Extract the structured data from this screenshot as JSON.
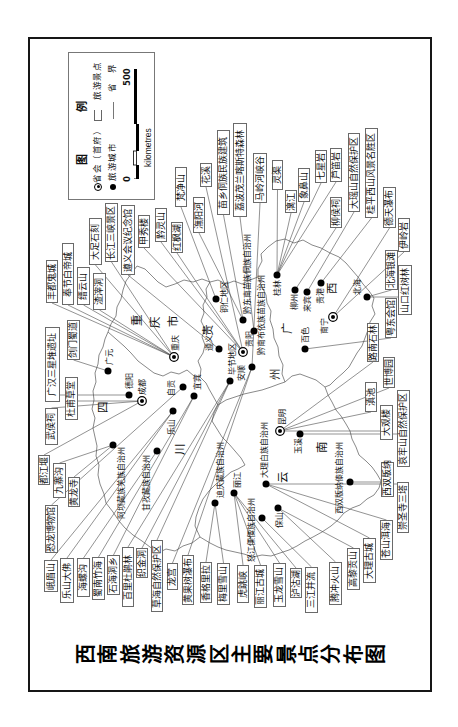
{
  "title": "西南旅游资源区主要景点分布图",
  "legend": {
    "title_chars": [
      "图",
      "例"
    ],
    "items": [
      {
        "symbol": "capital-circle",
        "label": "省会（首府）"
      },
      {
        "symbol": "label-box",
        "label": "旅游景点"
      },
      {
        "symbol": "black-dot",
        "label": "旅游城市"
      },
      {
        "symbol": "boundary-line",
        "label": "省　界"
      }
    ],
    "scale": {
      "start": "0",
      "end": "500",
      "unit": "kilometres"
    }
  },
  "map": {
    "provinces": [
      {
        "name": "重庆市",
        "chars": [
          {
            "c": "重",
            "x": 407,
            "y": 137
          },
          {
            "c": "庆",
            "x": 405,
            "y": 155
          },
          {
            "c": "市",
            "x": 406,
            "y": 173
          }
        ]
      },
      {
        "name": "四川",
        "chars": [
          {
            "c": "四",
            "x": 320,
            "y": 103
          },
          {
            "c": "川",
            "x": 278,
            "y": 180
          }
        ]
      },
      {
        "name": "贵州",
        "chars": [
          {
            "c": "贵",
            "x": 397,
            "y": 208
          },
          {
            "c": "州",
            "x": 353,
            "y": 275
          }
        ]
      },
      {
        "name": "云南",
        "chars": [
          {
            "c": "云",
            "x": 250,
            "y": 283
          },
          {
            "c": "南",
            "x": 280,
            "y": 322
          }
        ]
      },
      {
        "name": "广西",
        "chars": [
          {
            "c": "广",
            "x": 399,
            "y": 287
          },
          {
            "c": "西",
            "x": 439,
            "y": 332
          }
        ]
      }
    ],
    "cities": [
      {
        "name": "重庆",
        "type": "capital",
        "x": 370,
        "y": 174,
        "lx": 376,
        "ly": 176
      },
      {
        "name": "成都",
        "type": "capital",
        "x": 326,
        "y": 142,
        "lx": 332,
        "ly": 143
      },
      {
        "name": "贵阳",
        "type": "capital",
        "x": 375,
        "y": 243,
        "lx": 380,
        "ly": 250
      },
      {
        "name": "昆明",
        "type": "capital",
        "x": 296,
        "y": 280,
        "lx": 302,
        "ly": 283
      },
      {
        "name": "南宁",
        "type": "capital",
        "x": 410,
        "y": 333,
        "lx": 393,
        "ly": 325
      },
      {
        "name": "广元",
        "type": "city",
        "x": 356,
        "y": 108,
        "lx": 362,
        "ly": 110
      },
      {
        "name": "德阳",
        "type": "city",
        "x": 332,
        "y": 129,
        "lx": 338,
        "ly": 130
      },
      {
        "name": "自贡",
        "type": "city",
        "x": 340,
        "y": 183,
        "lx": 331,
        "ly": 172
      },
      {
        "name": "宜宾",
        "type": "city",
        "x": 331,
        "y": 194,
        "lx": 337,
        "ly": 198
      },
      {
        "name": "乐山",
        "type": "city",
        "x": 316,
        "y": 173,
        "lx": 292,
        "ly": 172
      },
      {
        "name": "阿坝藏族羌族自治州",
        "type": "city",
        "x": 282,
        "y": 113,
        "lx": 208,
        "ly": 122
      },
      {
        "name": "甘孜藏族自治州",
        "type": "city",
        "x": 276,
        "y": 157,
        "lx": 216,
        "ly": 147
      },
      {
        "name": "遵义",
        "type": "city",
        "x": 378,
        "y": 219,
        "lx": 376,
        "ly": 210
      },
      {
        "name": "毕节地区",
        "type": "city",
        "x": 346,
        "y": 230,
        "lx": 352,
        "ly": 233
      },
      {
        "name": "铜仁地区",
        "type": "city",
        "x": 428,
        "y": 216,
        "lx": 414,
        "ly": 225
      },
      {
        "name": "黔东南苗族侗族自治州",
        "type": "city",
        "x": 407,
        "y": 243,
        "lx": 413,
        "ly": 248
      },
      {
        "name": "黔南布依族苗族自治州",
        "type": "city",
        "x": 396,
        "y": 254,
        "lx": 372,
        "ly": 262
      },
      {
        "name": "安顺",
        "type": "city",
        "x": 360,
        "y": 252,
        "lx": 346,
        "ly": 242
      },
      {
        "name": "桂林",
        "type": "city",
        "x": 452,
        "y": 277,
        "lx": 431,
        "ly": 278
      },
      {
        "name": "柳州",
        "type": "city",
        "x": 437,
        "y": 295,
        "lx": 417,
        "ly": 295
      },
      {
        "name": "来宾",
        "type": "city",
        "x": 435,
        "y": 307,
        "lx": 415,
        "ly": 308
      },
      {
        "name": "贵港",
        "type": "city",
        "x": 444,
        "y": 321,
        "lx": 423,
        "ly": 321
      },
      {
        "name": "北海",
        "type": "city",
        "x": 430,
        "y": 367,
        "lx": 432,
        "ly": 358
      },
      {
        "name": "百色",
        "type": "city",
        "x": 378,
        "y": 305,
        "lx": 384,
        "ly": 306
      },
      {
        "name": "玉溪",
        "type": "city",
        "x": 293,
        "y": 300,
        "lx": 273,
        "ly": 299
      },
      {
        "name": "西双版纳傣族自治州",
        "type": "city",
        "x": 245,
        "y": 350,
        "lx": 213,
        "ly": 340
      },
      {
        "name": "大理白族自治州",
        "type": "city",
        "x": 243,
        "y": 266,
        "lx": 249,
        "ly": 265
      },
      {
        "name": "丽江",
        "type": "city",
        "x": 234,
        "y": 234,
        "lx": 239,
        "ly": 238
      },
      {
        "name": "迪庆藏族自治州",
        "type": "city",
        "x": 224,
        "y": 215,
        "lx": 229,
        "ly": 221
      },
      {
        "name": "怒江傈僳族自治州",
        "type": "city",
        "x": 209,
        "y": 262,
        "lx": 165,
        "ly": 252
      },
      {
        "name": "保山",
        "type": "city",
        "x": 219,
        "y": 278,
        "lx": 199,
        "ly": 280
      }
    ],
    "spots": [
      {
        "name": "丰都鬼城",
        "box": [
          424,
          46,
          43,
          12
        ],
        "target": "重庆"
      },
      {
        "name": "奉节白帝城",
        "box": [
          422,
          62,
          62,
          12
        ],
        "target": "重庆"
      },
      {
        "name": "缙云山",
        "box": [
          422,
          77,
          38,
          13
        ],
        "target": "重庆"
      },
      {
        "name": "渣滓洞",
        "box": [
          417,
          93,
          37,
          13
        ],
        "target": "重庆"
      },
      {
        "name": "大足石刻",
        "box": [
          462,
          89,
          47,
          13
        ],
        "target": "重庆"
      },
      {
        "name": "长江三峡景区",
        "box": [
          465,
          105,
          59,
          13
        ],
        "target": "重庆"
      },
      {
        "name": "遵义会议纪念馆",
        "box": [
          452,
          121,
          70,
          14
        ],
        "target": "遵义"
      },
      {
        "name": "甲秀楼",
        "box": [
          479,
          138,
          33,
          12
        ],
        "target": "贵阳"
      },
      {
        "name": "黔灵山",
        "box": [
          485,
          155,
          34,
          12
        ],
        "target": "贵阳"
      },
      {
        "name": "红枫湖",
        "box": [
          474,
          171,
          31,
          12
        ],
        "target": "贵阳"
      },
      {
        "name": "梵净山",
        "box": [
          520,
          175,
          40,
          12
        ],
        "target": "铜仁地区"
      },
      {
        "name": "潕阳河",
        "box": [
          494,
          193,
          36,
          12
        ],
        "target": "黔东南苗族侗族自治州"
      },
      {
        "name": "花溪",
        "box": [
          540,
          200,
          24,
          12
        ],
        "target": "贵阳"
      },
      {
        "name": "苗乡侗族民族建筑",
        "box": [
          512,
          217,
          85,
          13
        ],
        "target": "黔东南苗族侗族自治州"
      },
      {
        "name": "荔波茂兰喀斯特森林",
        "box": [
          510,
          233,
          94,
          14
        ],
        "target": "黔南布依族苗族自治州"
      },
      {
        "name": "马岭河峡谷",
        "box": [
          524,
          253,
          50,
          14
        ],
        "target": "安顺"
      },
      {
        "name": "灵渠",
        "box": [
          537,
          272,
          30,
          11
        ],
        "target": "桂林"
      },
      {
        "name": "漓江",
        "box": [
          514,
          285,
          23,
          12
        ],
        "target": "桂林"
      },
      {
        "name": "象鼻山",
        "box": [
          525,
          298,
          34,
          12
        ],
        "target": "桂林"
      },
      {
        "name": "七星岩",
        "box": [
          544,
          315,
          33,
          12
        ],
        "target": "桂林"
      },
      {
        "name": "芦笛岩",
        "box": [
          545,
          330,
          34,
          12
        ],
        "target": "桂林"
      },
      {
        "name": "柳侯祠",
        "box": [
          499,
          330,
          31,
          12
        ],
        "target": "柳州"
      },
      {
        "name": "大瑶山自然保护区",
        "box": [
          515,
          348,
          79,
          12
        ],
        "target": "来宾"
      },
      {
        "name": "桂平西山风景名胜区",
        "box": [
          509,
          365,
          90,
          13
        ],
        "target": "贵港"
      },
      {
        "name": "德天瀑布",
        "box": [
          499,
          383,
          41,
          13
        ],
        "target": "南宁"
      },
      {
        "name": "伊岭岩",
        "box": [
          475,
          398,
          34,
          12
        ],
        "target": "南宁"
      },
      {
        "name": "北海银滩",
        "box": [
          437,
          385,
          40,
          13
        ],
        "target": "北海"
      },
      {
        "name": "山口红树林",
        "box": [
          412,
          398,
          50,
          14
        ],
        "target": "北海"
      },
      {
        "name": "粤东会馆",
        "box": [
          389,
          385,
          40,
          12
        ],
        "target": "百色"
      },
      {
        "name": "路南石林",
        "box": [
          365,
          367,
          39,
          12
        ],
        "target": "昆明"
      },
      {
        "name": "世博园",
        "box": [
          339,
          383,
          31,
          12
        ],
        "target": "昆明"
      },
      {
        "name": "滇池",
        "box": [
          315,
          365,
          30,
          12
        ],
        "target": "昆明"
      },
      {
        "name": "大观楼",
        "box": [
          287,
          380,
          35,
          13
        ],
        "target": "昆明"
      },
      {
        "name": "哀牢山自然保护区",
        "box": [
          260,
          397,
          77,
          13
        ],
        "target": "玉溪"
      },
      {
        "name": "西双版纳",
        "box": [
          230,
          381,
          35,
          13
        ],
        "target": "西双版纳傣族自治州"
      },
      {
        "name": "崇圣寺三塔",
        "box": [
          194,
          397,
          51,
          12
        ],
        "target": "大理白族自治州"
      },
      {
        "name": "苍山洱海",
        "box": [
          167,
          380,
          40,
          13
        ],
        "target": "大理白族自治州"
      },
      {
        "name": "大理古城",
        "box": [
          144,
          363,
          45,
          13
        ],
        "target": "大理白族自治州"
      },
      {
        "name": "高黎贡山",
        "box": [
          137,
          347,
          42,
          13
        ],
        "target": "保山"
      },
      {
        "name": "腾冲火山",
        "box": [
          122,
          329,
          43,
          13
        ],
        "target": "保山"
      },
      {
        "name": "三江并流",
        "box": [
          114,
          305,
          46,
          13
        ],
        "target": "怒江傈僳族自治州"
      },
      {
        "name": "泸沽湖",
        "box": [
          129,
          290,
          30,
          12
        ],
        "target": "丽江"
      },
      {
        "name": "玉龙雪山",
        "box": [
          120,
          273,
          44,
          13
        ],
        "target": "丽江"
      },
      {
        "name": "丽江古城",
        "box": [
          119,
          254,
          43,
          13
        ],
        "target": "丽江"
      },
      {
        "name": "虎跳峡",
        "box": [
          124,
          237,
          38,
          12
        ],
        "target": "丽江"
      },
      {
        "name": "梅里雪山",
        "box": [
          122,
          217,
          42,
          13
        ],
        "target": "迪庆藏族自治州"
      },
      {
        "name": "香格里拉",
        "box": [
          124,
          200,
          41,
          12
        ],
        "target": "迪庆藏族自治州"
      },
      {
        "name": "黄果树瀑布",
        "box": [
          122,
          182,
          50,
          12
        ],
        "target": "安顺"
      },
      {
        "name": "龙宫",
        "box": [
          137,
          167,
          27,
          11
        ],
        "target": "安顺"
      },
      {
        "name": "草海自然保护区",
        "box": [
          115,
          151,
          72,
          12
        ],
        "target": "毕节地区"
      },
      {
        "name": "织金洞",
        "box": [
          149,
          136,
          30,
          12
        ],
        "target": "毕节地区"
      },
      {
        "name": "百里杜鹃林",
        "box": [
          120,
          122,
          60,
          12
        ],
        "target": "毕节地区"
      },
      {
        "name": "石海洞乡",
        "box": [
          132,
          107,
          40,
          13
        ],
        "target": "宜宾"
      },
      {
        "name": "蜀南竹海",
        "box": [
          127,
          92,
          43,
          13
        ],
        "target": "宜宾"
      },
      {
        "name": "海螺沟",
        "box": [
          130,
          77,
          39,
          13
        ],
        "target": "甘孜藏族自治州"
      },
      {
        "name": "乐山大佛",
        "box": [
          124,
          60,
          45,
          14
        ],
        "target": "乐山"
      },
      {
        "name": "峨眉山",
        "box": [
          135,
          44,
          32,
          14
        ],
        "target": "乐山"
      },
      {
        "name": "恐龙博物馆",
        "box": [
          174,
          45,
          48,
          13
        ],
        "target": "自贡"
      },
      {
        "name": "黄龙寺",
        "box": [
          220,
          68,
          30,
          12
        ],
        "target": "阿坝藏族羌族自治州"
      },
      {
        "name": "九寨沟",
        "box": [
          229,
          53,
          35,
          13
        ],
        "target": "阿坝藏族羌族自治州"
      },
      {
        "name": "都江堰",
        "box": [
          242,
          38,
          30,
          12
        ],
        "target": "成都"
      },
      {
        "name": "武侯祠",
        "box": [
          282,
          45,
          37,
          13
        ],
        "target": "成都"
      },
      {
        "name": "杜甫草堂",
        "box": [
          307,
          65,
          43,
          13
        ],
        "target": "成都"
      },
      {
        "name": "广汉三星堆遗址",
        "box": [
          325,
          45,
          75,
          15
        ],
        "target": "德阳"
      },
      {
        "name": "剑门蜀道",
        "box": [
          367,
          67,
          40,
          13
        ],
        "target": "广元"
      }
    ]
  }
}
